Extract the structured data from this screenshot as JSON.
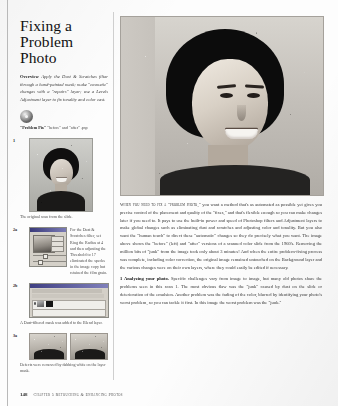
{
  "article": {
    "title_lines": [
      "Fixing a",
      "Problem",
      "Photo"
    ],
    "overview_label": "Overview",
    "overview_text": "Apply the Dust & Scratches filter through a hand-painted mask; make \"cosmetic\" changes with a \"repairs\" layer; use a Levels Adjustment layer to fix tonality and color cast.",
    "cd_caption_bold": "\"Problem Pix\"",
    "cd_caption_rest": "\"before\" and \"after\" .psp"
  },
  "figures": [
    {
      "number": "1",
      "caption": "The original scan from the slide.",
      "type": "portrait-thumb"
    },
    {
      "number": "2a",
      "caption": "For the Dust & Scratches filter, set Ring the Radius at 4 and then adjusting the Threshold to 17 eliminated the specks in the image copy but retained the film grain.",
      "type": "dialog-shot"
    },
    {
      "number": "2b",
      "caption": "A Dust-filtered mask was added to the Blend layer.",
      "type": "layers-palette"
    },
    {
      "number": "3a",
      "caption": "Defects were removed by dabbing white on the layer mask.",
      "type": "before-after-closeups"
    }
  ],
  "main": {
    "paragraphs": [
      {
        "lead": "When you need to fix a \"problem photo,\"",
        "text": " you want a method that's as automated as possible yet gives you precise control of the placement and quality of the \"fixes,\" and that's flexible enough so you can make changes later if you need to. It pays to use the built-in power and speed of Photoshop filters and Adjustment layers to make global changes such as eliminating dust and scratches and adjusting color and tonality. But you also want the \"human touch\" to direct these \"automatic\" changes so they do precisely what you want. The image above shows the \"before\" (left) and \"after\" versions of a scanned color slide from the 1960's. Removing the million bits of \"junk\" from the image took only about 3 minutes! And when the entire problem-fixing process was complete, including color correction, the original image remained untouched on the Background layer and the various changes were on their own layers, where they could easily be edited if necessary."
      },
      {
        "heading": "1 Analyzing your photo.",
        "text": " Specific challenges vary from image to image, but many old photos share the problems seen in this scan 1. The most obvious flaw was the \"junk\" caused by dust on the slide or deterioration of the emulsion. Another problem was the fading of the color, blurred by identifying your photo's worst problem, so you can tackle it first. In this image the worst problem was the \"junk.\""
      }
    ]
  },
  "footer": {
    "page_number": "148",
    "chapter_line": "Chapter 5 Retouching & Enhancing Photos"
  },
  "colors": {
    "page_background": "#fdfdfd",
    "ink": "#2b2b2b",
    "rule": "#b9b9b9"
  }
}
